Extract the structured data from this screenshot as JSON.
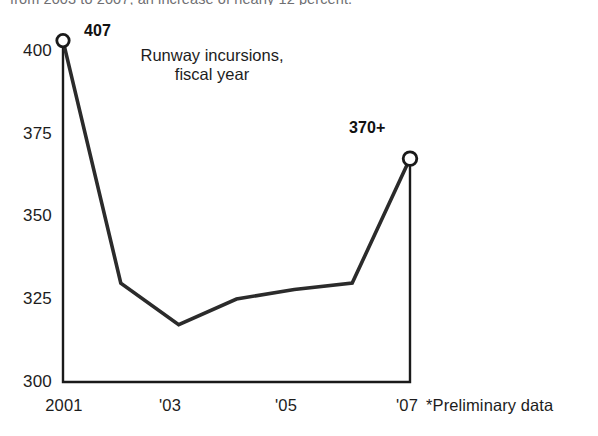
{
  "lede": {
    "text": "from 2003 to 2007, an increase of nearly 12 percent."
  },
  "chart_data": {
    "type": "line",
    "title": "Runway incursions,\nfiscal year",
    "title_line1": "Runway incursions,",
    "title_line2": "fiscal year",
    "xlabel": "",
    "ylabel": "",
    "ylim": [
      300,
      410
    ],
    "grid": false,
    "legend": null,
    "x": [
      2001,
      2002,
      2003,
      2004,
      2005,
      2006,
      2007
    ],
    "categories": [
      "2001",
      "2002",
      "2003",
      "2004",
      "2005",
      "2006",
      "2007"
    ],
    "values": [
      407,
      331,
      318,
      326,
      329,
      331,
      370
    ],
    "series": [
      {
        "name": "Runway incursions",
        "values": [
          407,
          331,
          318,
          326,
          329,
          331,
          370
        ]
      }
    ],
    "yticks": [
      300,
      325,
      350,
      375,
      400
    ],
    "ytick_labels": [
      "300",
      "325",
      "350",
      "375",
      "400"
    ],
    "xticks": [
      2001,
      2003,
      2005,
      2007
    ],
    "xtick_labels": [
      "2001",
      "'03",
      "'05",
      "'07"
    ],
    "annotations": [
      {
        "name": "first-point-label",
        "text": "407",
        "x": 2001,
        "y": 407
      },
      {
        "name": "last-point-label",
        "text": "370+",
        "x": 2007,
        "y": 370
      }
    ],
    "markers": [
      {
        "x": 2001,
        "y": 407
      },
      {
        "x": 2007,
        "y": 370
      }
    ],
    "line_color": "#2b2b2b",
    "marker_fill": "#ffffff",
    "axis_color": "#1a1a1a"
  },
  "footnote": {
    "text": "*Preliminary data"
  }
}
